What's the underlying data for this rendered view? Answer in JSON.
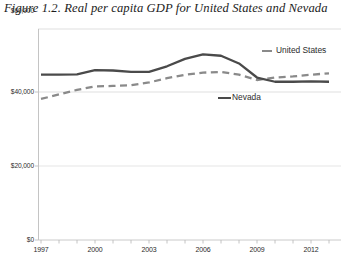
{
  "figure": {
    "title": "Figure 1.2. Real per capita GDP for United States and Nevada"
  },
  "legend": {
    "position": "inside-right",
    "entries": [
      {
        "label": "United States",
        "color": "#8a8a8a",
        "style": "dashed"
      },
      {
        "label": "Nevada",
        "color": "#4a4a4a",
        "style": "solid"
      }
    ]
  },
  "axis": {
    "y_ticks": [
      "$0",
      "$20,000",
      "$40,000",
      "$60,000"
    ],
    "x_ticks": [
      "1997",
      "2000",
      "2003",
      "2006",
      "2009",
      "2012"
    ]
  },
  "chart_data": {
    "type": "line",
    "title": "Figure 1.2. Real per capita GDP for United States and Nevada",
    "xlabel": "",
    "ylabel": "",
    "ylim": [
      0,
      60000
    ],
    "xlim": [
      1997,
      2013
    ],
    "grid": true,
    "y_tick_values": [
      0,
      20000,
      40000,
      60000
    ],
    "y_tick_labels": [
      "$0",
      "$20,000",
      "$40,000",
      "$60,000"
    ],
    "x_tick_values": [
      1997,
      2000,
      2003,
      2006,
      2009,
      2012
    ],
    "x_tick_labels": [
      "1997",
      "2000",
      "2003",
      "2006",
      "2009",
      "2012"
    ],
    "x": [
      1997,
      1998,
      1999,
      2000,
      2001,
      2002,
      2003,
      2004,
      2005,
      2006,
      2007,
      2008,
      2009,
      2010,
      2011,
      2012,
      2013
    ],
    "series": [
      {
        "name": "Nevada",
        "color": "#4a4a4a",
        "style": "solid",
        "values": [
          47000,
          47000,
          47100,
          48300,
          48200,
          47800,
          47800,
          49400,
          51500,
          52800,
          52400,
          50200,
          46200,
          45000,
          45000,
          45100,
          45000
        ]
      },
      {
        "name": "United States",
        "color": "#8a8a8a",
        "style": "dashed",
        "values": [
          40100,
          41400,
          42700,
          43700,
          43800,
          44000,
          44800,
          46000,
          47000,
          47600,
          47800,
          47000,
          45500,
          46200,
          46500,
          47000,
          47400
        ]
      }
    ]
  }
}
